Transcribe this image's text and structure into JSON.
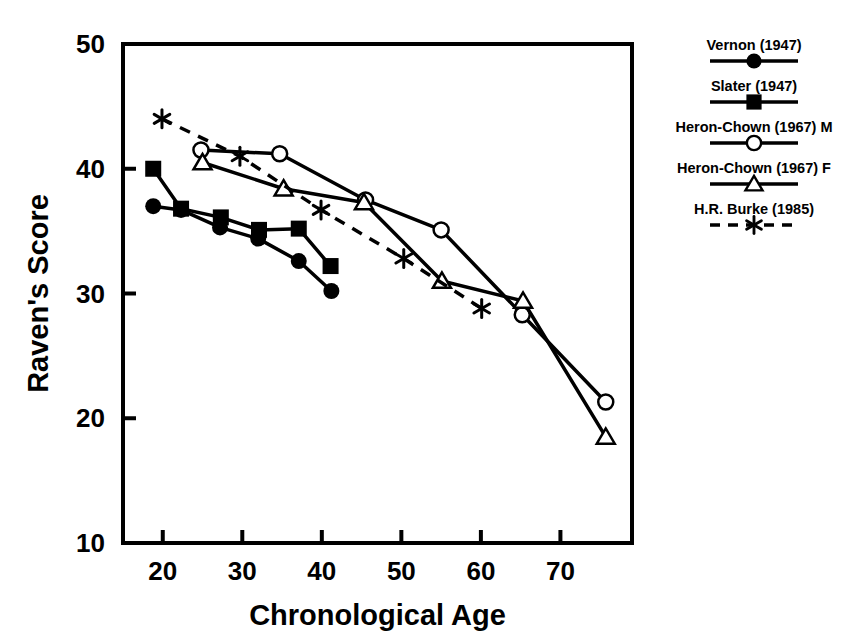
{
  "chart_data": {
    "type": "line",
    "title": "",
    "subtitle": "",
    "xlabel": "Chronological Age",
    "ylabel": "Raven's Score",
    "xlim": [
      15,
      79
    ],
    "ylim": [
      10,
      50
    ],
    "xticks": [
      20,
      30,
      40,
      50,
      60,
      70
    ],
    "yticks": [
      10,
      20,
      30,
      40,
      50
    ],
    "grid": false,
    "legend_position": "right",
    "series": [
      {
        "name": "Vernon (1947)",
        "marker": "filled-circle",
        "linestyle": "solid",
        "color": "#000000",
        "points": [
          {
            "x": 18.8,
            "y": 37.0
          },
          {
            "x": 22.3,
            "y": 36.7
          },
          {
            "x": 27.2,
            "y": 35.3
          },
          {
            "x": 32.0,
            "y": 34.4
          },
          {
            "x": 37.1,
            "y": 32.6
          },
          {
            "x": 41.2,
            "y": 30.2
          }
        ]
      },
      {
        "name": "Slater (1947)",
        "marker": "filled-square",
        "linestyle": "solid",
        "color": "#000000",
        "points": [
          {
            "x": 18.8,
            "y": 40.0
          },
          {
            "x": 22.3,
            "y": 36.8
          },
          {
            "x": 27.3,
            "y": 36.1
          },
          {
            "x": 32.1,
            "y": 35.1
          },
          {
            "x": 37.1,
            "y": 35.2
          },
          {
            "x": 41.1,
            "y": 32.2
          }
        ]
      },
      {
        "name": "Heron-Chown (1967) M",
        "marker": "open-circle",
        "linestyle": "solid",
        "color": "#000000",
        "points": [
          {
            "x": 24.8,
            "y": 41.5
          },
          {
            "x": 34.7,
            "y": 41.2
          },
          {
            "x": 45.5,
            "y": 37.5
          },
          {
            "x": 55.0,
            "y": 35.1
          },
          {
            "x": 65.2,
            "y": 28.3
          },
          {
            "x": 75.7,
            "y": 21.3
          }
        ]
      },
      {
        "name": "Heron-Chown (1967) F",
        "marker": "open-triangle",
        "linestyle": "solid",
        "color": "#000000",
        "points": [
          {
            "x": 25.0,
            "y": 40.5
          },
          {
            "x": 35.2,
            "y": 38.4
          },
          {
            "x": 45.3,
            "y": 37.3
          },
          {
            "x": 55.1,
            "y": 31.0
          },
          {
            "x": 65.3,
            "y": 29.4
          },
          {
            "x": 75.7,
            "y": 18.5
          }
        ]
      },
      {
        "name": "H.R. Burke (1985)",
        "marker": "asterisk",
        "linestyle": "dashed",
        "color": "#000000",
        "points": [
          {
            "x": 19.9,
            "y": 44.0
          },
          {
            "x": 29.7,
            "y": 41.0
          },
          {
            "x": 39.9,
            "y": 36.7
          },
          {
            "x": 50.3,
            "y": 32.8
          },
          {
            "x": 60.1,
            "y": 28.8
          }
        ]
      }
    ]
  },
  "legend": {
    "items": [
      {
        "label": "Vernon (1947)",
        "marker": "filled-circle",
        "linestyle": "solid"
      },
      {
        "label": "Slater (1947)",
        "marker": "filled-square",
        "linestyle": "solid"
      },
      {
        "label": "Heron-Chown (1967) M",
        "marker": "open-circle",
        "linestyle": "solid"
      },
      {
        "label": "Heron-Chown (1967) F",
        "marker": "open-triangle",
        "linestyle": "solid"
      },
      {
        "label": "H.R. Burke (1985)",
        "marker": "asterisk",
        "linestyle": "dashed"
      }
    ]
  },
  "axes": {
    "x_tick_labels": [
      "20",
      "30",
      "40",
      "50",
      "60",
      "70"
    ],
    "y_tick_labels": [
      "50",
      "40",
      "30",
      "20",
      "10"
    ],
    "x_axis_title": "Chronological Age",
    "y_axis_title": "Raven's Score"
  }
}
